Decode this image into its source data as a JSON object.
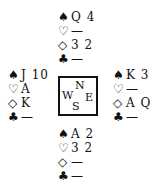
{
  "suits": {
    "spades": "♠",
    "hearts": "♡",
    "diamonds": "◇",
    "clubs": "♣"
  },
  "north": {
    "spades": "Q 4",
    "hearts": "—",
    "diamonds": "3 2",
    "clubs": "—"
  },
  "west": {
    "spades": "J 10",
    "hearts": "A",
    "diamonds": "K",
    "clubs": "—"
  },
  "east": {
    "spades": "K 3",
    "hearts": "—",
    "diamonds": "A Q",
    "clubs": "—"
  },
  "south": {
    "spades": "A 2",
    "hearts": "3 2",
    "diamonds": "—",
    "clubs": "—"
  },
  "compass": {
    "n": "N",
    "w": "W",
    "e": "E",
    "s": "S"
  }
}
